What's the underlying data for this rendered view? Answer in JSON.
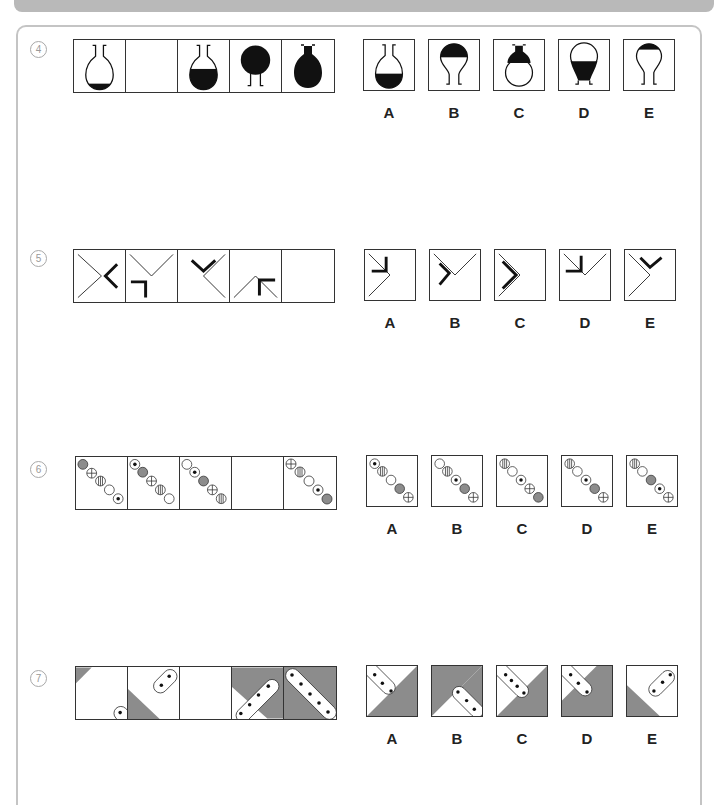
{
  "questions": [
    {
      "number": "4",
      "sequence": [
        "flask-small-fill",
        "blank",
        "flask-half-fill",
        "flask-inverted-full",
        "flask-full"
      ],
      "options": [
        {
          "label": "A",
          "figure": "flask-bottom-fill"
        },
        {
          "label": "B",
          "figure": "inverted-flask-top-fill"
        },
        {
          "label": "C",
          "figure": "flask-neck-fill"
        },
        {
          "label": "D",
          "figure": "inverted-flask-neck-fill"
        },
        {
          "label": "E",
          "figure": "inverted-flask-small-top-fill"
        }
      ]
    },
    {
      "number": "5",
      "sequence": [
        "cross-chevron-left",
        "v-corner-bottomleft",
        "diag-chevron-top",
        "caret-arrow-topleft",
        "blank"
      ],
      "options": [
        {
          "label": "A"
        },
        {
          "label": "B"
        },
        {
          "label": "C"
        },
        {
          "label": "D"
        },
        {
          "label": "E"
        }
      ]
    },
    {
      "number": "6",
      "sequence": [
        "beads-1",
        "beads-2",
        "beads-3",
        "blank",
        "beads-5"
      ],
      "options": [
        {
          "label": "A"
        },
        {
          "label": "B"
        },
        {
          "label": "C"
        },
        {
          "label": "D"
        },
        {
          "label": "E"
        }
      ]
    },
    {
      "number": "7",
      "sequence": [
        "corner-1",
        "corner-2",
        "blank",
        "corner-4",
        "corner-5"
      ],
      "options": [
        {
          "label": "A"
        },
        {
          "label": "B"
        },
        {
          "label": "C"
        },
        {
          "label": "D"
        },
        {
          "label": "E"
        }
      ]
    }
  ],
  "colors": {
    "ink": "#111111",
    "grey_fill": "#8c8c8c",
    "frame": "#c4c4c4",
    "topbar": "#b9b9b9"
  }
}
